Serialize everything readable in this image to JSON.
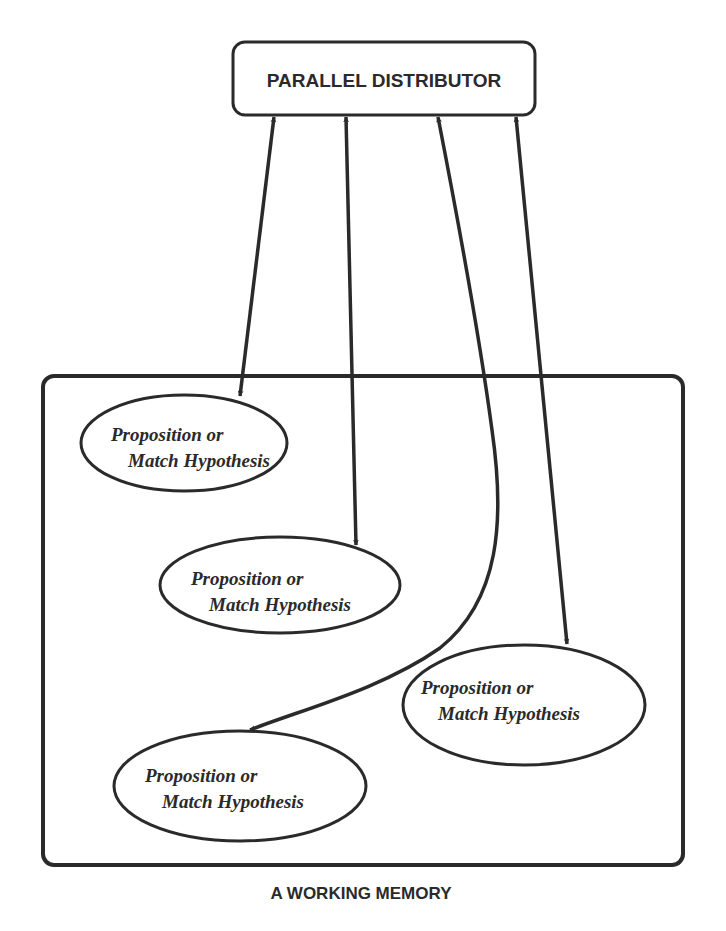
{
  "distributor": {
    "label": "PARALLEL DISTRIBUTOR"
  },
  "working_memory": {
    "label": "A WORKING MEMORY"
  },
  "nodes": [
    {
      "id": "node-1",
      "line1": "Proposition or",
      "line2": "Match Hypothesis"
    },
    {
      "id": "node-2",
      "line1": "Proposition or",
      "line2": "Match Hypothesis"
    },
    {
      "id": "node-3",
      "line1": "Proposition or",
      "line2": "Match Hypothesis"
    },
    {
      "id": "node-4",
      "line1": "Proposition or",
      "line2": "Match Hypothesis"
    }
  ],
  "connections": [
    {
      "from": "distributor",
      "to": "node-1",
      "bidirectional": true
    },
    {
      "from": "distributor",
      "to": "node-2",
      "bidirectional": true
    },
    {
      "from": "distributor",
      "to": "node-4",
      "bidirectional": true,
      "curved": true
    },
    {
      "from": "distributor",
      "to": "node-3",
      "bidirectional": true
    }
  ],
  "colors": {
    "ink": "#2a2a2a",
    "background": "#ffffff"
  }
}
